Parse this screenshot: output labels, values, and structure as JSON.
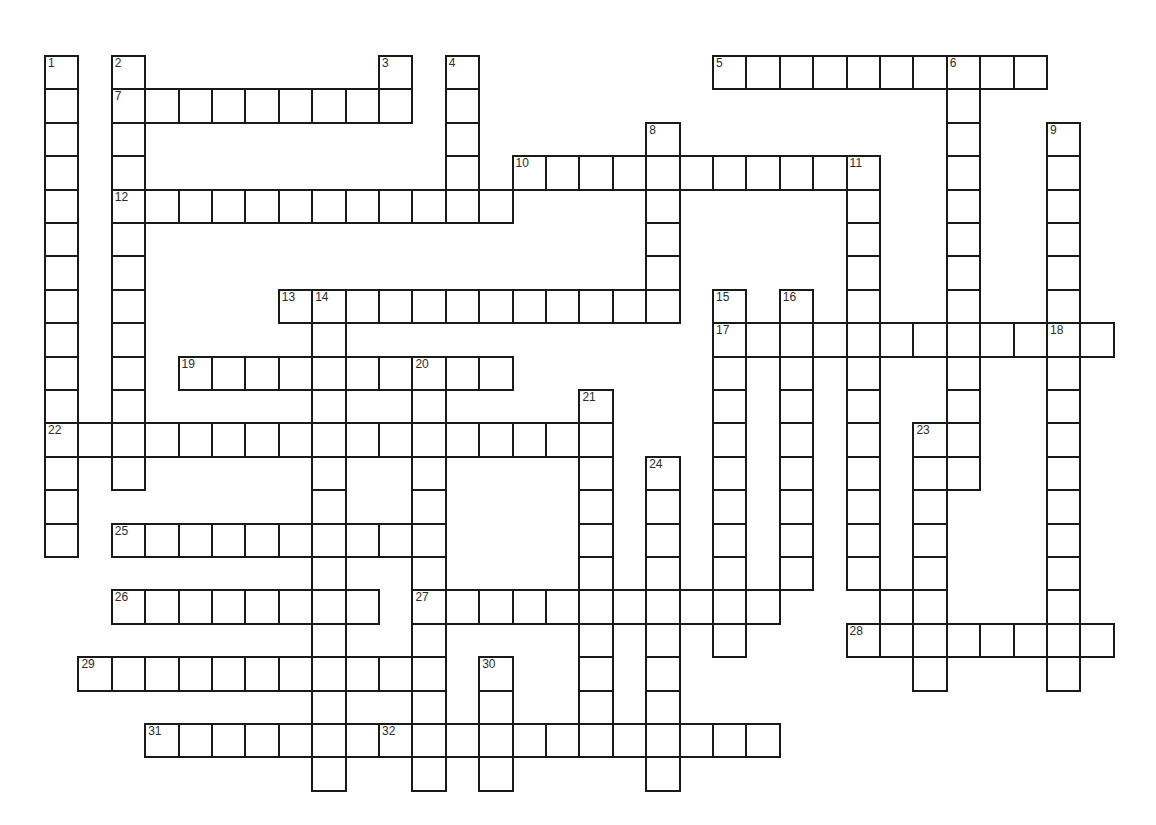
{
  "puzzle": {
    "title": "Crossword Puzzle Grid",
    "grid": {
      "cell_size": 33.4,
      "origin_x": 44,
      "origin_y": 55,
      "columns": 33,
      "rows": 23,
      "cell_fill": "#ffffff",
      "line_color": "#1a1a1a",
      "background": "#ffffff",
      "number_color": "#2b2b2b"
    },
    "entries": [
      {
        "number": "1",
        "direction": "down",
        "col": 0,
        "row": 0,
        "length": 15
      },
      {
        "number": "2",
        "direction": "down",
        "col": 2,
        "row": 0,
        "length": 13
      },
      {
        "number": "3",
        "direction": "down",
        "col": 10,
        "row": 0,
        "length": 2
      },
      {
        "number": "4",
        "direction": "down",
        "col": 12,
        "row": 0,
        "length": 5
      },
      {
        "number": "5",
        "direction": "across",
        "col": 20,
        "row": 0,
        "length": 10
      },
      {
        "number": "6",
        "direction": "down",
        "col": 27,
        "row": 0,
        "length": 13
      },
      {
        "number": "7",
        "direction": "across",
        "col": 2,
        "row": 1,
        "length": 9
      },
      {
        "number": "8",
        "direction": "down",
        "col": 18,
        "row": 2,
        "length": 6
      },
      {
        "number": "9",
        "direction": "down",
        "col": 30,
        "row": 2,
        "length": 11
      },
      {
        "number": "10",
        "direction": "across",
        "col": 14,
        "row": 3,
        "length": 11
      },
      {
        "number": "11",
        "direction": "down",
        "col": 24,
        "row": 3,
        "length": 13
      },
      {
        "number": "12",
        "direction": "across",
        "col": 2,
        "row": 4,
        "length": 12
      },
      {
        "number": "13",
        "direction": "across",
        "col": 7,
        "row": 7,
        "length": 12
      },
      {
        "number": "14",
        "direction": "down",
        "col": 8,
        "row": 7,
        "length": 15
      },
      {
        "number": "15",
        "direction": "down",
        "col": 20,
        "row": 7,
        "length": 11
      },
      {
        "number": "16",
        "direction": "down",
        "col": 22,
        "row": 7,
        "length": 9
      },
      {
        "number": "17",
        "direction": "across",
        "col": 20,
        "row": 8,
        "length": 12
      },
      {
        "number": "18",
        "direction": "down",
        "col": 30,
        "row": 8,
        "length": 11
      },
      {
        "number": "19",
        "direction": "across",
        "col": 4,
        "row": 9,
        "length": 10
      },
      {
        "number": "20",
        "direction": "down",
        "col": 11,
        "row": 9,
        "length": 13
      },
      {
        "number": "21",
        "direction": "down",
        "col": 16,
        "row": 10,
        "length": 10
      },
      {
        "number": "22",
        "direction": "across",
        "col": 0,
        "row": 11,
        "length": 14
      },
      {
        "number": "23",
        "direction": "down",
        "col": 26,
        "row": 11,
        "length": 8
      },
      {
        "number": "24",
        "direction": "down",
        "col": 18,
        "row": 12,
        "length": 10
      },
      {
        "number": "25",
        "direction": "across",
        "col": 2,
        "row": 14,
        "length": 9
      },
      {
        "number": "26",
        "direction": "across",
        "col": 2,
        "row": 16,
        "length": 8
      },
      {
        "number": "27",
        "direction": "across",
        "col": 11,
        "row": 16,
        "length": 11
      },
      {
        "number": "28",
        "direction": "across",
        "col": 24,
        "row": 17,
        "length": 8
      },
      {
        "number": "29",
        "direction": "across",
        "col": 1,
        "row": 18,
        "length": 10
      },
      {
        "number": "30",
        "direction": "down",
        "col": 13,
        "row": 18,
        "length": 4
      },
      {
        "number": "31",
        "direction": "across",
        "col": 3,
        "row": 20,
        "length": 8
      },
      {
        "number": "32",
        "direction": "across",
        "col": 10,
        "row": 20,
        "length": 12
      }
    ],
    "extra_cells": [
      {
        "col": 12,
        "row": 7
      },
      {
        "col": 13,
        "row": 7
      },
      {
        "col": 14,
        "row": 7
      },
      {
        "col": 15,
        "row": 7
      },
      {
        "col": 16,
        "row": 7
      },
      {
        "col": 17,
        "row": 7
      },
      {
        "col": 18,
        "row": 7
      },
      {
        "col": 14,
        "row": 11
      },
      {
        "col": 15,
        "row": 11
      },
      {
        "col": 25,
        "row": 8
      },
      {
        "col": 26,
        "row": 8
      },
      {
        "col": 27,
        "row": 8
      },
      {
        "col": 28,
        "row": 8
      },
      {
        "col": 29,
        "row": 8
      },
      {
        "col": 31,
        "row": 8
      },
      {
        "col": 25,
        "row": 16
      },
      {
        "col": 25,
        "row": 17
      },
      {
        "col": 26,
        "row": 17
      },
      {
        "col": 27,
        "row": 17
      },
      {
        "col": 28,
        "row": 17
      },
      {
        "col": 29,
        "row": 17
      },
      {
        "col": 30,
        "row": 17
      },
      {
        "col": 31,
        "row": 17
      }
    ]
  }
}
